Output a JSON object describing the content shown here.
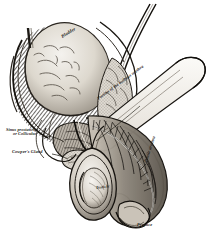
{
  "figure": {
    "kind": "anatomical-engraving",
    "style": "steel engraving, cross-hatched grayscale",
    "background_color": "#ffffff",
    "ink_color": "#1a1714",
    "width": 213,
    "height": 232
  },
  "labels": {
    "bladder": "Bladder",
    "sinus_line1": "Sinus prostaticus",
    "sinus_line2": "or Colliculus",
    "cowper": "Cowper's Gland",
    "bulbous": "Portion of the bulbous urethra",
    "penile": "Penile urethra",
    "testicle": "Testicle",
    "prepuce": "Prepuce"
  },
  "structures": [
    {
      "name": "bladder",
      "note": "large pale dome, upper left"
    },
    {
      "name": "ureter",
      "note": "small tube entering bladder at top left"
    },
    {
      "name": "vas-deferens",
      "note": "paired ducts descending at upper right"
    },
    {
      "name": "seminal-vesicle",
      "note": "lobulated body behind prostate"
    },
    {
      "name": "prostate-gland",
      "note": "below bladder neck"
    },
    {
      "name": "cowpers-gland",
      "note": "small rounded gland below prostate"
    },
    {
      "name": "bulbous-urethra",
      "note": "reflected flap at right"
    },
    {
      "name": "corpus-cavernosum",
      "note": "shaft of penis curving downward"
    },
    {
      "name": "penile-urethra",
      "note": "channel along shaft"
    },
    {
      "name": "glans-penis",
      "note": "distal end, lower right"
    },
    {
      "name": "prepuce",
      "note": "fold over the glans"
    },
    {
      "name": "scrotum",
      "note": "sac lower centre"
    },
    {
      "name": "testicle",
      "note": "ovoid body within scrotum"
    }
  ]
}
